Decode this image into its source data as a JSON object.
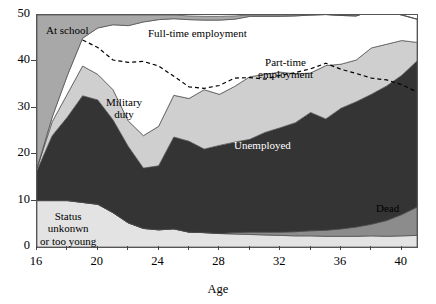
{
  "chart_data": {
    "type": "area",
    "title": "",
    "subtitle": "",
    "xlabel": "Age",
    "ylabel": "",
    "xlim": [
      16,
      41
    ],
    "ylim": [
      0,
      50
    ],
    "grid": false,
    "legend_position": "inline-annotations",
    "stacked": true,
    "x": [
      16,
      17,
      18,
      19,
      20,
      21,
      22,
      23,
      24,
      25,
      26,
      27,
      28,
      29,
      30,
      31,
      32,
      33,
      34,
      35,
      36,
      37,
      38,
      39,
      40,
      41
    ],
    "xticks": [
      16,
      18,
      20,
      22,
      24,
      26,
      28,
      30,
      32,
      34,
      36,
      38,
      40
    ],
    "xtick_labels": [
      "16",
      "",
      "20",
      "",
      "24",
      "",
      "28",
      "",
      "32",
      "",
      "36",
      "",
      "40"
    ],
    "yticks": [
      0,
      10,
      20,
      30,
      40,
      50
    ],
    "ytick_labels": [
      "0",
      "10",
      "20",
      "30",
      "40",
      "50"
    ],
    "series": [
      {
        "name": "Status unkonwn or too young",
        "color": "#e3e3e3",
        "values": [
          10,
          10,
          10,
          9.6,
          9.2,
          7.4,
          5.2,
          4.0,
          3.7,
          3.9,
          3.2,
          3.1,
          2.9,
          2.8,
          2.7,
          2.6,
          2.5,
          2.4,
          2.4,
          2.3,
          2.3,
          2.3,
          2.4,
          2.3,
          2.4,
          2.5
        ]
      },
      {
        "name": "Dead",
        "color": "#8c8c8c",
        "values": [
          0,
          0,
          0,
          0,
          0,
          0,
          0,
          0,
          0,
          0,
          0,
          0,
          0,
          0.3,
          0.5,
          0.6,
          0.7,
          0.9,
          1.1,
          1.3,
          1.6,
          2.0,
          2.5,
          3.4,
          4.6,
          6.1
        ]
      },
      {
        "name": "Unemployed",
        "color": "#343434",
        "values": [
          6.5,
          14.0,
          18.0,
          23.0,
          22.5,
          20.0,
          16.5,
          13.0,
          13.8,
          19.8,
          19.6,
          18.0,
          19.0,
          19.5,
          20.0,
          21.5,
          22.5,
          23.5,
          25.5,
          24.0,
          26.0,
          27.0,
          28.0,
          29.0,
          30.0,
          31.5
        ]
      },
      {
        "name": "Part-time employment",
        "color": "#cfcfcf",
        "values": [
          0.5,
          3.0,
          5.0,
          6.4,
          5.5,
          6.5,
          5.5,
          7.0,
          8.5,
          9.0,
          9.2,
          12.8,
          11.0,
          12.0,
          13.5,
          12.5,
          12.0,
          10.5,
          8.5,
          11.5,
          9.5,
          9.0,
          10.0,
          9.0,
          7.5,
          4.0
        ]
      },
      {
        "name": "Full-time employment",
        "color": "#ffffff",
        "values": [
          0,
          1.0,
          4.0,
          6.0,
          10.0,
          14.0,
          20.5,
          24.5,
          23.0,
          16.5,
          17.0,
          15.0,
          16.0,
          14.5,
          13.0,
          12.5,
          12.0,
          12.5,
          12.5,
          11.0,
          10.5,
          9.5,
          8.0,
          7.0,
          5.5,
          5.0
        ]
      },
      {
        "name": "At school",
        "color": "#a8a8a8",
        "values": [
          33.0,
          22.0,
          13.0,
          5.0,
          2.8,
          2.1,
          2.3,
          1.5,
          1.0,
          0.8,
          0.8,
          0.8,
          0.8,
          0.7,
          0.3,
          0.3,
          0.3,
          0.2,
          0.0,
          0.0,
          0.0,
          0.0,
          0.0,
          0.0,
          0.0,
          0.0
        ]
      }
    ],
    "reference_line": {
      "name": "dashed-reference-line",
      "style": "dashed",
      "color": "#000000",
      "values": [
        null,
        null,
        null,
        44.6,
        43.0,
        40.3,
        39.8,
        40.0,
        39.0,
        36.8,
        34.5,
        34.2,
        34.8,
        36.4,
        36.5,
        36.2,
        37.0,
        37.6,
        38.4,
        39.6,
        38.3,
        37.4,
        36.4,
        36.0,
        35.0,
        33.4
      ]
    },
    "annotations": [
      {
        "name": "at-school-label",
        "text": "At school",
        "x_px": 46,
        "y_px": 24,
        "on_dark": false
      },
      {
        "name": "full-time-employment-label",
        "text": "Full-time employment",
        "x_px": 148,
        "y_px": 27,
        "on_dark": false
      },
      {
        "name": "military-duty-label",
        "text": "Military\nduty",
        "x_px": 106,
        "y_px": 96,
        "on_dark": false
      },
      {
        "name": "part-time-employment-label",
        "text": "Part-time\nemployment",
        "x_px": 258,
        "y_px": 56,
        "on_dark": false
      },
      {
        "name": "unemployed-label",
        "text": "Unemployed",
        "x_px": 234,
        "y_px": 139,
        "on_dark": true
      },
      {
        "name": "status-unknown-label",
        "text": "Status\nunkonwn\nor too young",
        "x_px": 40,
        "y_px": 210,
        "on_dark": false
      },
      {
        "name": "dead-label",
        "text": "Dead",
        "x_px": 376,
        "y_px": 202,
        "on_dark": false
      }
    ]
  },
  "axis": {
    "x_title": "Age"
  }
}
